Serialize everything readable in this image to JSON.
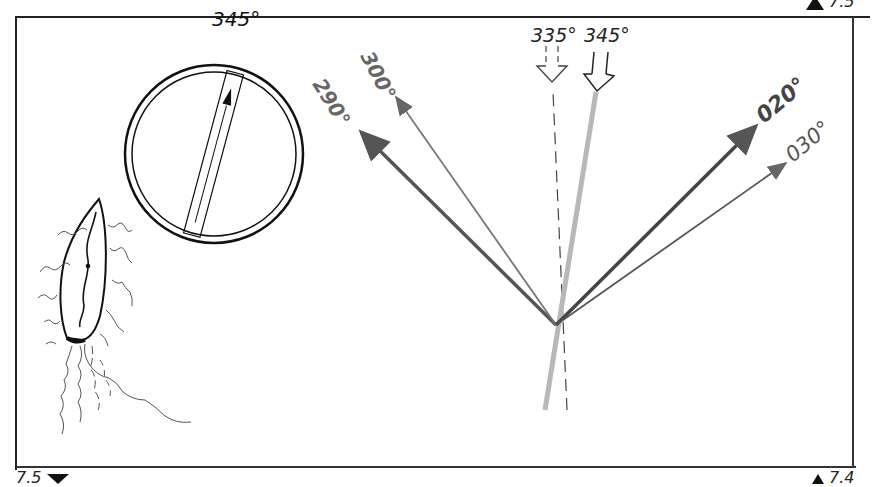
{
  "figure": {
    "corner_labels": {
      "top_right": "7.5",
      "bottom_left": "7.5",
      "bottom_right": "7.4"
    },
    "compass": {
      "heading_label": "345°",
      "heading_deg": 345
    },
    "course_arrows": [
      {
        "label": "290°",
        "bearing_deg": 290,
        "color": "#555555",
        "weight": "thick"
      },
      {
        "label": "300°",
        "bearing_deg": 300,
        "color": "#777777",
        "weight": "thin"
      },
      {
        "label": "335°",
        "bearing_deg": 335,
        "color": "#444444",
        "weight": "dashed"
      },
      {
        "label": "345°",
        "bearing_deg": 345,
        "color": "#b5b5b5",
        "weight": "thick-light"
      },
      {
        "label": "020°",
        "bearing_deg": 20,
        "color": "#444444",
        "weight": "thick"
      },
      {
        "label": "030°",
        "bearing_deg": 30,
        "color": "#666666",
        "weight": "thin"
      }
    ],
    "boat": {
      "description": "sailing boat with wake, top view"
    }
  }
}
